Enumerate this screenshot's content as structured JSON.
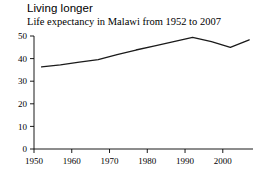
{
  "chart_data": {
    "type": "line",
    "title": "Living longer",
    "subtitle": "Life expectancy in Malawi from 1952 to 2007",
    "xlabel": "",
    "ylabel": "",
    "grid": false,
    "legend": "none",
    "xlim": [
      1950,
      2008
    ],
    "ylim": [
      0,
      50
    ],
    "xticks": [
      1950,
      1960,
      1970,
      1980,
      1990,
      2000
    ],
    "xtick_labels": [
      "1950",
      "1960",
      "1970",
      "1980",
      "1990",
      "2000"
    ],
    "yticks": [
      0,
      10,
      20,
      30,
      40,
      50
    ],
    "ytick_labels": [
      "0",
      "10",
      "20",
      "30",
      "40",
      "50"
    ],
    "series": [
      {
        "name": "Malawi life expectancy",
        "color": "#1a1a1a",
        "x": [
          1952,
          1957,
          1962,
          1967,
          1972,
          1977,
          1982,
          1987,
          1992,
          1997,
          2002,
          2007
        ],
        "values": [
          36.3,
          37.2,
          38.4,
          39.5,
          41.8,
          43.8,
          45.6,
          47.5,
          49.4,
          47.5,
          45.0,
          48.3
        ]
      }
    ]
  },
  "axes": {
    "y_axis_name": "value-axis",
    "x_axis_name": "year-axis"
  }
}
